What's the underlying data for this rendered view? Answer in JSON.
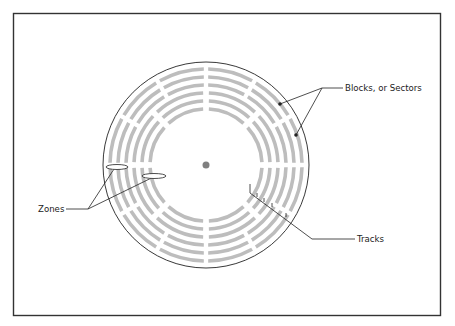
{
  "diagram": {
    "labels": {
      "blocks": "Blocks, or Sectors",
      "tracks": "Tracks",
      "zones": "Zones"
    },
    "colors": {
      "frame": "#333333",
      "disk_outline": "#222222",
      "track_fill": "#bdbdbd",
      "spindle": "#808080",
      "leader": "#222222"
    },
    "frame": {
      "x": 13.5,
      "y": 13.5,
      "width": 427,
      "height": 302
    },
    "disk": {
      "cx": 206,
      "cy": 165,
      "r": 103,
      "spindle_r": 3.5
    },
    "zones": [
      {
        "name": "outer",
        "track_radii": [
          96,
          88,
          80
        ],
        "sector_count": 12,
        "gap_degrees": 2.6,
        "offset_degrees": 0
      },
      {
        "name": "inner",
        "track_radii": [
          72,
          64,
          56
        ],
        "sector_count": 8,
        "gap_degrees": 3.4,
        "offset_degrees": 0
      }
    ],
    "annotations": {
      "blocks": {
        "text_x": 345,
        "text_y": 91,
        "knee": [
          322,
          88
        ],
        "dots": [
          [
            280,
            104
          ],
          [
            296,
            135
          ]
        ]
      },
      "tracks": {
        "text_x": 357,
        "text_y": 242,
        "knee": [
          312,
          239
        ],
        "line_start": [
          250,
          193
        ],
        "tick_points": [
          [
            257,
            197
          ],
          [
            264,
            202
          ],
          [
            272,
            207
          ],
          [
            286,
            217
          ]
        ]
      },
      "zones": {
        "text_x": 38,
        "text_y": 212,
        "knee": [
          88,
          209
        ],
        "ellipses": [
          [
            117,
            167,
            11,
            2.5
          ],
          [
            154,
            176,
            12,
            2.5
          ]
        ]
      }
    }
  }
}
